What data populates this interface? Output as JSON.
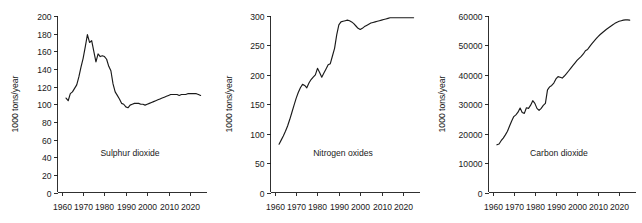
{
  "figure": {
    "background_color": "#ffffff",
    "line_color": "#1a1a1a",
    "panel_count": 3
  },
  "chart_data": [
    {
      "type": "line",
      "title": "Sulphur dioxide",
      "xlabel": "",
      "ylabel": "1000 tons/year",
      "xlim": [
        1958,
        2028
      ],
      "ylim": [
        0,
        200
      ],
      "xticks": [
        1960,
        1970,
        1980,
        1990,
        2000,
        2010,
        2020
      ],
      "xticklabels": [
        "1960",
        "1970",
        "1980",
        "1990",
        "2000",
        "2010",
        "2020"
      ],
      "yticks": [
        0,
        20,
        40,
        60,
        80,
        100,
        120,
        140,
        160,
        180,
        200
      ],
      "yticklabels": [
        "0",
        "20",
        "40",
        "60",
        "80",
        "100",
        "120",
        "140",
        "160",
        "180",
        "200"
      ],
      "grid": false,
      "legend": "none",
      "x": [
        1962,
        1963,
        1964,
        1965,
        1966,
        1967,
        1968,
        1969,
        1970,
        1971,
        1972,
        1973,
        1974,
        1975,
        1976,
        1977,
        1978,
        1979,
        1980,
        1981,
        1982,
        1983,
        1984,
        1985,
        1986,
        1987,
        1988,
        1989,
        1990,
        1991,
        1992,
        1993,
        1994,
        1995,
        1996,
        1997,
        1998,
        1999,
        2000,
        2001,
        2002,
        2003,
        2004,
        2005,
        2006,
        2007,
        2008,
        2009,
        2010,
        2011,
        2012,
        2013,
        2014,
        2015,
        2016,
        2017,
        2018,
        2019,
        2020,
        2021,
        2022,
        2023,
        2024,
        2025
      ],
      "values": [
        107,
        104,
        112,
        114,
        118,
        122,
        131,
        142,
        152,
        165,
        179,
        170,
        172,
        160,
        148,
        157,
        154,
        155,
        154,
        151,
        143,
        138,
        123,
        114,
        110,
        106,
        101,
        100,
        97,
        96,
        99,
        100,
        101,
        101,
        101,
        100,
        100,
        99,
        100,
        101,
        102,
        103,
        104,
        105,
        106,
        107,
        108,
        109,
        110,
        111,
        111,
        111,
        111,
        110,
        111,
        111,
        111,
        112,
        112,
        112,
        112,
        112,
        111,
        110
      ]
    },
    {
      "type": "line",
      "title": "Nitrogen oxides",
      "xlabel": "",
      "ylabel": "1000 tons/year",
      "xlim": [
        1958,
        2028
      ],
      "ylim": [
        0,
        300
      ],
      "xticks": [
        1960,
        1970,
        1980,
        1990,
        2000,
        2010,
        2020
      ],
      "xticklabels": [
        "1960",
        "1970",
        "1980",
        "1990",
        "2000",
        "2010",
        "2020"
      ],
      "yticks": [
        0,
        50,
        100,
        150,
        200,
        250,
        300
      ],
      "yticklabels": [
        "0",
        "50",
        "100",
        "150",
        "200",
        "250",
        "300"
      ],
      "grid": false,
      "legend": "none",
      "x": [
        1962,
        1963,
        1964,
        1965,
        1966,
        1967,
        1968,
        1969,
        1970,
        1971,
        1972,
        1973,
        1974,
        1975,
        1976,
        1977,
        1978,
        1979,
        1980,
        1981,
        1982,
        1983,
        1984,
        1985,
        1986,
        1987,
        1988,
        1989,
        1990,
        1991,
        1992,
        1993,
        1994,
        1995,
        1996,
        1997,
        1998,
        1999,
        2000,
        2001,
        2002,
        2003,
        2004,
        2005,
        2006,
        2007,
        2008,
        2009,
        2010,
        2011,
        2012,
        2013,
        2014,
        2015,
        2016,
        2017,
        2018,
        2019,
        2020,
        2021,
        2022,
        2023,
        2024,
        2025
      ],
      "values": [
        82,
        89,
        96,
        104,
        113,
        124,
        136,
        148,
        160,
        170,
        178,
        184,
        182,
        178,
        186,
        192,
        196,
        200,
        211,
        204,
        196,
        203,
        210,
        217,
        219,
        232,
        245,
        268,
        285,
        290,
        291,
        292,
        293,
        292,
        290,
        287,
        283,
        279,
        277,
        279,
        282,
        284,
        286,
        288,
        289,
        290,
        291,
        292,
        293,
        294,
        295,
        296,
        297,
        297,
        297,
        297,
        297,
        297,
        297,
        297,
        297,
        297,
        297,
        297
      ]
    },
    {
      "type": "line",
      "title": "Carbon dioxide",
      "xlabel": "",
      "ylabel": "1000 tons/year",
      "xlim": [
        1958,
        2028
      ],
      "ylim": [
        0,
        60000
      ],
      "xticks": [
        1960,
        1970,
        1980,
        1990,
        2000,
        2010,
        2020
      ],
      "xticklabels": [
        "1960",
        "1970",
        "1980",
        "1990",
        "2000",
        "2010",
        "2020"
      ],
      "yticks": [
        0,
        10000,
        20000,
        30000,
        40000,
        50000,
        60000
      ],
      "yticklabels": [
        "0",
        "10000",
        "20000",
        "30000",
        "40000",
        "50000",
        "60000"
      ],
      "grid": false,
      "legend": "none",
      "x": [
        1962,
        1963,
        1964,
        1965,
        1966,
        1967,
        1968,
        1969,
        1970,
        1971,
        1972,
        1973,
        1974,
        1975,
        1976,
        1977,
        1978,
        1979,
        1980,
        1981,
        1982,
        1983,
        1984,
        1985,
        1986,
        1987,
        1988,
        1989,
        1990,
        1991,
        1992,
        1993,
        1994,
        1995,
        1996,
        1997,
        1998,
        1999,
        2000,
        2001,
        2002,
        2003,
        2004,
        2005,
        2006,
        2007,
        2008,
        2009,
        2010,
        2011,
        2012,
        2013,
        2014,
        2015,
        2016,
        2017,
        2018,
        2019,
        2020,
        2021,
        2022,
        2023,
        2024,
        2025
      ],
      "values": [
        16200,
        16500,
        17600,
        18500,
        19600,
        20800,
        22600,
        24300,
        25800,
        26400,
        27300,
        28700,
        27200,
        26900,
        28800,
        28600,
        29700,
        31200,
        30300,
        28600,
        27900,
        28600,
        29600,
        30300,
        34900,
        35900,
        36400,
        37200,
        38600,
        39400,
        39200,
        38900,
        39600,
        40400,
        41300,
        42200,
        43100,
        44000,
        44900,
        45600,
        46300,
        47100,
        48200,
        48600,
        49600,
        50500,
        51400,
        52200,
        53000,
        53700,
        54300,
        54900,
        55500,
        56000,
        56500,
        57000,
        57500,
        57900,
        58200,
        58400,
        58600,
        58700,
        58700,
        58600
      ]
    }
  ]
}
